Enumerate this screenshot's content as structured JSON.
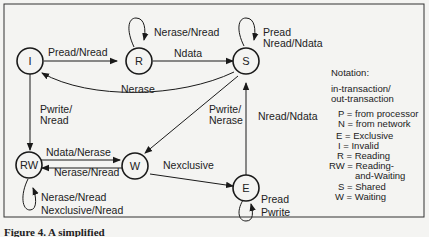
{
  "diagram": {
    "states": [
      {
        "id": "I",
        "label": "I"
      },
      {
        "id": "R",
        "label": "R"
      },
      {
        "id": "S",
        "label": "S"
      },
      {
        "id": "RW",
        "label": "RW"
      },
      {
        "id": "W",
        "label": "W"
      },
      {
        "id": "E",
        "label": "E"
      }
    ],
    "transitions": [
      {
        "from": "I",
        "to": "R",
        "label": "Pread/Nread"
      },
      {
        "from": "R",
        "to": "R",
        "label": "Nerase/Nread"
      },
      {
        "from": "R",
        "to": "S",
        "label": "Ndata"
      },
      {
        "from": "S",
        "to": "S",
        "label1": "Pread",
        "label2": "Nread/Ndata"
      },
      {
        "from": "S",
        "to": "I",
        "label": "Nerase"
      },
      {
        "from": "I",
        "to": "RW",
        "label1": "Pwrite/",
        "label2": "Nread"
      },
      {
        "from": "S",
        "to": "W",
        "label1": "Pwrite/",
        "label2": "Nerase"
      },
      {
        "from": "E",
        "to": "S",
        "label": "Nread/Ndata"
      },
      {
        "from": "RW",
        "to": "W",
        "label": "Ndata/Nerase"
      },
      {
        "from": "W",
        "to": "RW",
        "label": "Nerase/Nread"
      },
      {
        "from": "W",
        "to": "E",
        "label": "Nexclusive"
      },
      {
        "from": "RW",
        "to": "RW",
        "label1": "Nerase/Nread",
        "label2": "Nexclusive/Nread"
      },
      {
        "from": "E",
        "to": "E",
        "label1": "Pread",
        "label2": "Pwrite"
      }
    ],
    "notation": {
      "title": "Notation:",
      "line1": "in-transaction/",
      "line2": "out-transaction",
      "p": "P = from processor",
      "n": "N = from network",
      "e": "E = Exclusive",
      "i": "I = Invalid",
      "r": "R = Reading",
      "rw1": "RW = Reading-",
      "rw2": "and-Waiting",
      "s": "S = Shared",
      "w": "W = Waiting"
    },
    "caption": "Figure 4. A simplified"
  }
}
